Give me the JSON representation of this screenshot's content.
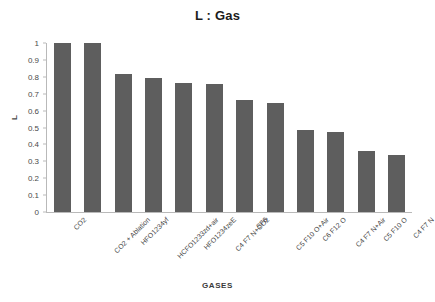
{
  "chart_data": {
    "type": "bar",
    "title": "L : Gas",
    "xlabel": "GASES",
    "ylabel": "L",
    "ylim": [
      0,
      1
    ],
    "ytick_labels": [
      "1",
      "0.9",
      "0.8",
      "0.7",
      "0.6",
      "0.5",
      "0.4",
      "0.3",
      "0.2",
      "0.1",
      "0"
    ],
    "ytick_values": [
      1,
      0.9,
      0.8,
      0.7,
      0.6,
      0.5,
      0.4,
      0.3,
      0.2,
      0.1,
      0
    ],
    "grid": false,
    "legend": "none",
    "bar_color": "#5e5e5e",
    "categories": [
      "CO2",
      "CO2 + Ablation",
      "HFO1234yf",
      "HCFO1233zd+air",
      "HFO1234zeE",
      "C4 F7 N+CO2",
      "SF6",
      "C5 F10 O+Air",
      "C6 F12 O",
      "C4 F7 N+Air",
      "C5 F10 O",
      "C4 F7 N"
    ],
    "values": [
      1.0,
      1.0,
      0.815,
      0.795,
      0.762,
      0.76,
      0.66,
      0.645,
      0.485,
      0.475,
      0.363,
      0.34
    ]
  }
}
